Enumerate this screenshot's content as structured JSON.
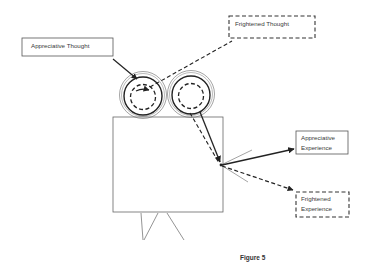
{
  "diagram": {
    "labels": {
      "appreciative_thought": "Appreciative Thought",
      "frightened_thought": "Frightened Thought",
      "appreciative_experience": [
        "Appreciative",
        "Experience"
      ],
      "frightened_experience": [
        "Frightened",
        "Experience"
      ]
    },
    "caption": "Figure 5",
    "colors": {
      "stroke": "#333333",
      "thin_stroke": "#555555",
      "text": "#3a3a3a",
      "background": "#ffffff"
    },
    "relations": [
      {
        "from": "Appreciative Thought",
        "to": "camera-left-reel",
        "style": "solid"
      },
      {
        "from": "camera-left-reel",
        "to": "Frightened Thought",
        "style": "dashed"
      },
      {
        "from": "camera-right-reel",
        "to": "camera-lens",
        "style": "solid"
      },
      {
        "from": "camera-right-reel",
        "to": "camera-lens",
        "style": "dashed"
      },
      {
        "from": "camera-lens",
        "to": "Appreciative Experience",
        "style": "solid"
      },
      {
        "from": "camera-lens",
        "to": "Frightened Experience",
        "style": "dashed"
      }
    ]
  }
}
